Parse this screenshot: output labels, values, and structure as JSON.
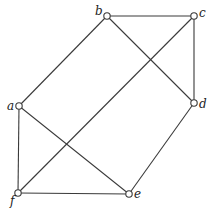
{
  "diagram": {
    "type": "graph",
    "nodes": [
      {
        "id": "a",
        "label": "a",
        "x": 19,
        "y": 106,
        "label_dx": -12,
        "label_dy": 4
      },
      {
        "id": "b",
        "label": "b",
        "x": 107,
        "y": 16,
        "label_dx": -12,
        "label_dy": -1
      },
      {
        "id": "c",
        "label": "c",
        "x": 194,
        "y": 16,
        "label_dx": 5,
        "label_dy": 1
      },
      {
        "id": "d",
        "label": "d",
        "x": 194,
        "y": 103,
        "label_dx": 5,
        "label_dy": 5
      },
      {
        "id": "e",
        "label": "e",
        "x": 129,
        "y": 194,
        "label_dx": 5,
        "label_dy": 4
      },
      {
        "id": "f",
        "label": "f",
        "x": 18,
        "y": 193,
        "label_dx": -8,
        "label_dy": 12
      }
    ],
    "edges": [
      [
        "a",
        "b"
      ],
      [
        "b",
        "c"
      ],
      [
        "b",
        "d"
      ],
      [
        "c",
        "d"
      ],
      [
        "c",
        "f"
      ],
      [
        "a",
        "f"
      ],
      [
        "a",
        "e"
      ],
      [
        "d",
        "e"
      ],
      [
        "f",
        "e"
      ]
    ]
  }
}
